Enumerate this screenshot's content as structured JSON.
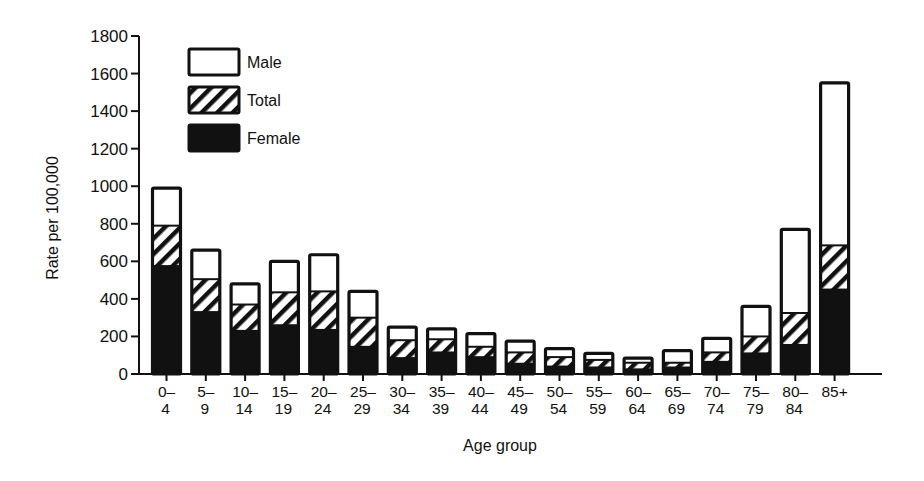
{
  "chart_data": {
    "type": "bar",
    "stacked_overlay": true,
    "title": "",
    "xlabel": "Age group",
    "ylabel": "Rate per 100,000",
    "ylim": [
      0,
      1800
    ],
    "yticks": [
      0,
      200,
      400,
      600,
      800,
      1000,
      1200,
      1400,
      1600,
      1800
    ],
    "grid": false,
    "legend_position": "upper-left",
    "categories": [
      [
        "0–",
        "4"
      ],
      [
        "5–",
        "9"
      ],
      [
        "10–",
        "14"
      ],
      [
        "15–",
        "19"
      ],
      [
        "20–",
        "24"
      ],
      [
        "25–",
        "29"
      ],
      [
        "30–",
        "34"
      ],
      [
        "35–",
        "39"
      ],
      [
        "40–",
        "44"
      ],
      [
        "45–",
        "49"
      ],
      [
        "50–",
        "54"
      ],
      [
        "55–",
        "59"
      ],
      [
        "60–",
        "64"
      ],
      [
        "65–",
        "69"
      ],
      [
        "70–",
        "74"
      ],
      [
        "75–",
        "79"
      ],
      [
        "80–",
        "84"
      ],
      [
        "85+",
        ""
      ]
    ],
    "category_names": [
      "0-4",
      "5-9",
      "10-14",
      "15-19",
      "20-24",
      "25-29",
      "30-34",
      "35-39",
      "40-44",
      "45-49",
      "50-54",
      "55-59",
      "60-64",
      "65-69",
      "70-74",
      "75-79",
      "80-84",
      "85+"
    ],
    "series": [
      {
        "name": "Male",
        "fill": "white",
        "values": [
          990,
          660,
          480,
          600,
          635,
          440,
          250,
          240,
          215,
          175,
          135,
          110,
          85,
          125,
          190,
          360,
          770,
          1550
        ]
      },
      {
        "name": "Total",
        "fill": "hatched",
        "values": [
          790,
          505,
          370,
          435,
          440,
          300,
          180,
          185,
          145,
          115,
          90,
          75,
          60,
          60,
          115,
          200,
          325,
          685
        ]
      },
      {
        "name": "Female",
        "fill": "black",
        "values": [
          580,
          335,
          235,
          265,
          240,
          150,
          90,
          120,
          95,
          60,
          45,
          40,
          30,
          40,
          70,
          115,
          160,
          455
        ]
      }
    ],
    "legend": [
      {
        "label": "Male",
        "fill": "white"
      },
      {
        "label": "Total",
        "fill": "hatched"
      },
      {
        "label": "Female",
        "fill": "black"
      }
    ],
    "colors": {
      "ink": "#111111",
      "background": "#ffffff"
    }
  }
}
